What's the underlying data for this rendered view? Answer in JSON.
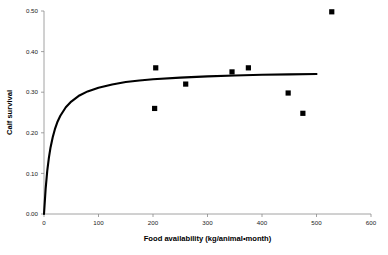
{
  "chart_data": {
    "type": "scatter",
    "title": "",
    "xlabel": "Food availability (kg/animal•month)",
    "ylabel": "Calf survival",
    "xlim": [
      0,
      600
    ],
    "ylim": [
      0,
      0.5
    ],
    "xticks": [
      0,
      100,
      200,
      300,
      400,
      500,
      600
    ],
    "xtick_labels": [
      "0",
      "100",
      "200",
      "300",
      "400",
      "500",
      "600"
    ],
    "yticks": [
      0.0,
      0.1,
      0.2,
      0.3,
      0.4,
      0.5
    ],
    "ytick_labels": [
      "0.00",
      "0.10",
      "0.20",
      "0.30",
      "0.40",
      "0.50"
    ],
    "grid": false,
    "legend": false,
    "marker_color": "#000000",
    "curve_color": "#000000",
    "axis_color": "#8a8a8a",
    "series": [
      {
        "name": "Observed data",
        "type": "scatter",
        "marker": "square",
        "points": [
          {
            "x": 203,
            "y": 0.26
          },
          {
            "x": 205,
            "y": 0.36
          },
          {
            "x": 260,
            "y": 0.32
          },
          {
            "x": 345,
            "y": 0.35
          },
          {
            "x": 375,
            "y": 0.36
          },
          {
            "x": 448,
            "y": 0.298
          },
          {
            "x": 475,
            "y": 0.248
          },
          {
            "x": 528,
            "y": 0.498
          }
        ]
      },
      {
        "name": "Fitted saturating curve",
        "type": "line",
        "asymptote": 0.355,
        "half_saturation": 14,
        "x_range": [
          0,
          500
        ],
        "points": [
          {
            "x": 0,
            "y": 0.0
          },
          {
            "x": 3,
            "y": 0.062
          },
          {
            "x": 6,
            "y": 0.107
          },
          {
            "x": 9,
            "y": 0.139
          },
          {
            "x": 12,
            "y": 0.164
          },
          {
            "x": 16,
            "y": 0.189
          },
          {
            "x": 20,
            "y": 0.209
          },
          {
            "x": 25,
            "y": 0.228
          },
          {
            "x": 30,
            "y": 0.242
          },
          {
            "x": 40,
            "y": 0.263
          },
          {
            "x": 50,
            "y": 0.277
          },
          {
            "x": 65,
            "y": 0.292
          },
          {
            "x": 80,
            "y": 0.302
          },
          {
            "x": 100,
            "y": 0.311
          },
          {
            "x": 125,
            "y": 0.319
          },
          {
            "x": 150,
            "y": 0.325
          },
          {
            "x": 175,
            "y": 0.329
          },
          {
            "x": 200,
            "y": 0.332
          },
          {
            "x": 250,
            "y": 0.336
          },
          {
            "x": 300,
            "y": 0.339
          },
          {
            "x": 350,
            "y": 0.341
          },
          {
            "x": 400,
            "y": 0.343
          },
          {
            "x": 450,
            "y": 0.344
          },
          {
            "x": 500,
            "y": 0.345
          }
        ]
      }
    ]
  }
}
